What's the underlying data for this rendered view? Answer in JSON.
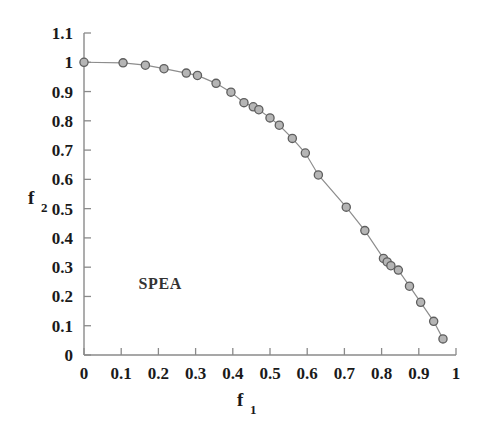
{
  "chart_data": {
    "type": "scatter",
    "title": "",
    "subtitle": "",
    "xlabel": "f_1",
    "ylabel": "f_2",
    "xlabel_display": "f",
    "xlabel_sub": "1",
    "ylabel_display": "f",
    "ylabel_sub": "2",
    "xlim": [
      0,
      1
    ],
    "ylim": [
      0,
      1.1
    ],
    "grid": false,
    "legend": null,
    "legend_position": "none",
    "annotations": [
      {
        "text": "SPEA",
        "x": 0.205,
        "y": 0.225
      }
    ],
    "xticks": [
      0,
      0.1,
      0.2,
      0.3,
      0.4,
      0.5,
      0.6,
      0.7,
      0.8,
      0.9,
      1
    ],
    "xtick_labels": [
      "0",
      "0.1",
      "0.2",
      "0.3",
      "0.4",
      "0.5",
      "0.6",
      "0.7",
      "0.8",
      "0.9",
      "1"
    ],
    "yticks": [
      0,
      0.1,
      0.2,
      0.3,
      0.4,
      0.5,
      0.6,
      0.7,
      0.8,
      0.9,
      1,
      1.1
    ],
    "ytick_labels": [
      "0",
      "0.1",
      "0.2",
      "0.3",
      "0.4",
      "0.5",
      "0.6",
      "0.7",
      "0.8",
      "0.9",
      "1",
      "1.1"
    ],
    "series": [
      {
        "name": "SPEA Pareto front",
        "marker": "circle",
        "marker_fill": "#b5b5b5",
        "marker_edge": "#5e5e5e",
        "line_color": "#8d8d8d",
        "x": [
          0.0,
          0.105,
          0.165,
          0.215,
          0.275,
          0.305,
          0.355,
          0.395,
          0.43,
          0.455,
          0.47,
          0.5,
          0.525,
          0.56,
          0.595,
          0.63,
          0.705,
          0.755,
          0.805,
          0.815,
          0.825,
          0.845,
          0.875,
          0.905,
          0.94,
          0.965
        ],
        "y": [
          1.0,
          0.998,
          0.99,
          0.978,
          0.963,
          0.955,
          0.928,
          0.898,
          0.862,
          0.848,
          0.838,
          0.81,
          0.785,
          0.74,
          0.69,
          0.615,
          0.505,
          0.425,
          0.33,
          0.318,
          0.305,
          0.29,
          0.235,
          0.18,
          0.115,
          0.055
        ]
      }
    ]
  },
  "axes": {
    "x_axis_name": "f1-axis",
    "y_axis_name": "f2-axis"
  }
}
